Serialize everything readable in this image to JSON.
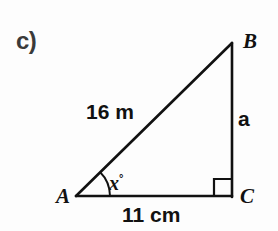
{
  "figure": {
    "part_label": "c)",
    "shape": "right-triangle",
    "background_color": "#fdfdfd",
    "stroke_color": "#111111",
    "vertices": {
      "a": {
        "label": "A",
        "x": 76,
        "y": 196
      },
      "b": {
        "label": "B",
        "x": 232,
        "y": 43
      },
      "c": {
        "label": "C",
        "x": 231,
        "y": 196
      }
    },
    "sides": {
      "hypotenuse": {
        "from": "A",
        "to": "B",
        "value": "16",
        "unit": "m",
        "label": "16 m"
      },
      "base": {
        "from": "A",
        "to": "C",
        "value": "11",
        "unit": "cm",
        "label": "11 cm"
      },
      "opposite": {
        "from": "B",
        "to": "C",
        "label": "a"
      }
    },
    "angles": {
      "at_a": {
        "label": "x",
        "degree_symbol": "°",
        "label_full": "x°",
        "marker": "arc"
      },
      "at_c": {
        "marker": "right-angle-square",
        "value_degrees": 90
      }
    }
  }
}
